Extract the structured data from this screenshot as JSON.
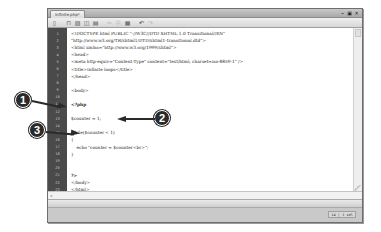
{
  "window": {
    "tab_title": "infinite.php*",
    "controls": [
      {
        "name": "minimize",
        "glyph": "–"
      },
      {
        "name": "restore",
        "glyph": "▣"
      },
      {
        "name": "close",
        "glyph": "✕"
      }
    ]
  },
  "toolbar": {
    "buttons": [
      {
        "name": "new-document",
        "glyph": "▯"
      },
      {
        "name": "open",
        "glyph": "⊓"
      },
      {
        "name": "save",
        "glyph": "▨"
      },
      {
        "name": "save-all",
        "glyph": "◫"
      },
      {
        "name": "print",
        "glyph": "▤"
      },
      {
        "name": "cut",
        "glyph": "✂"
      },
      {
        "name": "copy",
        "glyph": "⎘"
      },
      {
        "name": "paste",
        "glyph": "▦"
      },
      {
        "name": "undo",
        "glyph": "↶"
      },
      {
        "name": "redo",
        "glyph": "↷"
      }
    ]
  },
  "editor": {
    "lines": [
      {
        "n": "1",
        "text": "<!DOCTYPE html PUBLIC \"-//W3C//DTD XHTML 1.0 Transitional//EN\""
      },
      {
        "n": "2",
        "text": "\"http://www.w3.org/TR/xhtml1/DTD/xhtml1-transitional.dtd\">"
      },
      {
        "n": "3",
        "text": "<html xmlns=\"http://www.w3.org/1999/xhtml\">"
      },
      {
        "n": "4",
        "text": "<head>"
      },
      {
        "n": "5",
        "text": "<meta http-equiv=\"Content-Type\" content=\"text/html; charset=iso-8859-1\" />"
      },
      {
        "n": "6",
        "text": "<title>Infinite loops</title>"
      },
      {
        "n": "7",
        "text": "</head>"
      },
      {
        "n": "8",
        "text": ""
      },
      {
        "n": "9",
        "text": "<body>"
      },
      {
        "n": "10",
        "text": ""
      },
      {
        "n": "11",
        "text": "<?php"
      },
      {
        "n": "12",
        "text": ""
      },
      {
        "n": "13",
        "text": "$counter = 1;"
      },
      {
        "n": "14",
        "text": ""
      },
      {
        "n": "15",
        "text": "while($counter < 1)"
      },
      {
        "n": "16",
        "text": "{"
      },
      {
        "n": "17",
        "text": "    echo \"counter = $counter<br>\";"
      },
      {
        "n": "18",
        "text": "}"
      },
      {
        "n": "19",
        "text": ""
      },
      {
        "n": "20",
        "text": ""
      },
      {
        "n": "21",
        "text": "?>"
      },
      {
        "n": "22",
        "text": "</body>"
      },
      {
        "n": "23",
        "text": "</html>"
      }
    ]
  },
  "status": {
    "position": "14 | 1 sel"
  },
  "callouts": [
    {
      "number": "1",
      "target": "line 13: $counter = 1;"
    },
    {
      "number": "2",
      "target": "line 15: while($counter < 1)"
    },
    {
      "number": "3",
      "target": "line 17: echo statement"
    }
  ],
  "colors": {
    "gutter": "#4a4a4a",
    "callout": "#2a2a2a",
    "editor_bg": "#ffffff"
  }
}
